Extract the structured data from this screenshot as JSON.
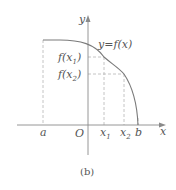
{
  "figure": {
    "caption": "(b)",
    "curve_label": "y=f(x)",
    "axes": {
      "x_label": "x",
      "y_label": "y",
      "origin_label": "O"
    },
    "x_ticks": [
      {
        "label": "a"
      },
      {
        "label": "x",
        "sub": "1"
      },
      {
        "label": "x",
        "sub": "2"
      },
      {
        "label": "b"
      }
    ],
    "y_ticks": [
      {
        "label": "f(x",
        "sub": "1",
        "close": ")"
      },
      {
        "label": "f(x",
        "sub": "2",
        "close": ")"
      }
    ],
    "colors": {
      "curve": "#7a7a7a",
      "axis": "#8a8a8a",
      "dash": "#b0b0b0",
      "text": "#555555"
    }
  }
}
